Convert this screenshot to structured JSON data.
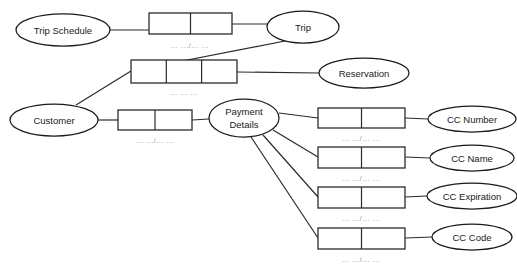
{
  "diagram": {
    "type": "entity-relationship-diagram",
    "background_color": "#ffffff",
    "stroke_color": "#2b2b2b",
    "cardinality_text_color": "#8c8c8c",
    "entities": [
      {
        "id": "trip-schedule",
        "label": "Trip Schedule",
        "cx": 63,
        "cy": 30,
        "rx": 47,
        "ry": 16
      },
      {
        "id": "trip",
        "label": "Trip",
        "cx": 303,
        "cy": 27,
        "rx": 36,
        "ry": 16
      },
      {
        "id": "reservation",
        "label": "Reservation",
        "cx": 364,
        "cy": 73,
        "rx": 45,
        "ry": 15
      },
      {
        "id": "customer",
        "label": "Customer",
        "cx": 54,
        "cy": 120,
        "rx": 44,
        "ry": 16
      },
      {
        "id": "payment-details",
        "label_line1": "Payment",
        "label_line2": "Details",
        "cx": 244,
        "cy": 118,
        "rx": 35,
        "ry": 19
      },
      {
        "id": "cc-number",
        "label": "CC Number",
        "cx": 472,
        "cy": 119,
        "rx": 44,
        "ry": 13
      },
      {
        "id": "cc-name",
        "label": "CC Name",
        "cx": 472,
        "cy": 158,
        "rx": 42,
        "ry": 13
      },
      {
        "id": "cc-expiration",
        "label": "CC Expiration",
        "cx": 472,
        "cy": 196,
        "rx": 45,
        "ry": 13
      },
      {
        "id": "cc-code",
        "label": "CC Code",
        "cx": 472,
        "cy": 237,
        "rx": 40,
        "ry": 13
      }
    ],
    "relationship_boxes": [
      {
        "id": "rel-trip-schedule-trip",
        "x": 149,
        "y": 13,
        "w": 83,
        "h": 21,
        "cells": 2,
        "cardinality": "... .../... ..."
      },
      {
        "id": "rel-customer-trip",
        "x": 131,
        "y": 60,
        "w": 106,
        "h": 23,
        "cells": 3,
        "cardinality": "... ... ..."
      },
      {
        "id": "rel-customer-payment",
        "x": 118,
        "y": 110,
        "w": 74,
        "h": 20,
        "cells": 2,
        "cardinality": "... .../... ..."
      },
      {
        "id": "rel-cc-number",
        "x": 318,
        "y": 108,
        "w": 87,
        "h": 20,
        "cells": 2,
        "cardinality": "... .../... ..."
      },
      {
        "id": "rel-cc-name",
        "x": 318,
        "y": 147,
        "w": 87,
        "h": 21,
        "cells": 2,
        "cardinality": "... .../... ..."
      },
      {
        "id": "rel-cc-expiration",
        "x": 318,
        "y": 187,
        "w": 87,
        "h": 21,
        "cells": 2,
        "cardinality": "... .../... ..."
      },
      {
        "id": "rel-cc-code",
        "x": 318,
        "y": 228,
        "w": 87,
        "h": 21,
        "cells": 2,
        "cardinality": "... .../... ..."
      }
    ],
    "connectors": [
      {
        "id": "conn-trip-schedule-to-rel",
        "from": "trip-schedule",
        "to": "rel-trip-schedule-trip",
        "points": "110,30 149,30"
      },
      {
        "id": "conn-rel-to-trip",
        "from": "rel-trip-schedule-trip",
        "to": "trip",
        "points": "232,27 268,27"
      },
      {
        "id": "conn-trip-to-rel-customer",
        "from": "trip",
        "to": "rel-customer-trip",
        "points": "288,41 131,72"
      },
      {
        "id": "conn-rel-customer-to-reservation",
        "from": "rel-customer-trip",
        "to": "reservation",
        "points": "237,72 319,73"
      },
      {
        "id": "conn-customer-to-rel-trip",
        "from": "customer",
        "to": "rel-customer-trip",
        "points": "74,106 131,72"
      },
      {
        "id": "conn-customer-to-rel-payment",
        "from": "customer",
        "to": "rel-customer-payment",
        "points": "98,120 118,120"
      },
      {
        "id": "conn-rel-payment-to-payment-details",
        "from": "rel-customer-payment",
        "to": "payment-details",
        "points": "192,120 209,119"
      },
      {
        "id": "conn-payment-to-rel-cc-number",
        "from": "payment-details",
        "to": "rel-cc-number",
        "points": "279,114 318,118"
      },
      {
        "id": "conn-payment-to-rel-cc-name",
        "from": "payment-details",
        "to": "rel-cc-name",
        "points": "272,131 318,157"
      },
      {
        "id": "conn-payment-to-rel-cc-expiration",
        "from": "payment-details",
        "to": "rel-cc-expiration",
        "points": "262,136 318,197"
      },
      {
        "id": "conn-payment-to-rel-cc-code",
        "from": "payment-details",
        "to": "rel-cc-code",
        "points": "250,137 318,238"
      },
      {
        "id": "conn-rel-cc-number-to-entity",
        "from": "rel-cc-number",
        "to": "cc-number",
        "points": "405,118 428,119"
      },
      {
        "id": "conn-rel-cc-name-to-entity",
        "from": "rel-cc-name",
        "to": "cc-name",
        "points": "405,157 430,158"
      },
      {
        "id": "conn-rel-cc-expiration-to-entity",
        "from": "rel-cc-expiration",
        "to": "cc-expiration",
        "points": "405,197 427,196"
      },
      {
        "id": "conn-rel-cc-code-to-entity",
        "from": "rel-cc-code",
        "to": "cc-code",
        "points": "405,238 432,237"
      }
    ]
  }
}
